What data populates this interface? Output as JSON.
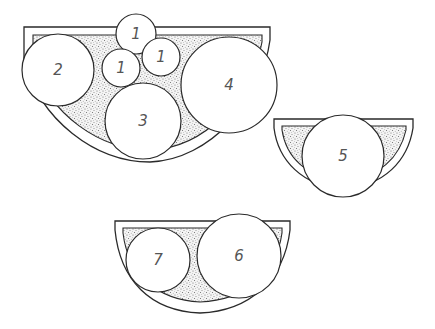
{
  "diagram": {
    "type": "planting-plan",
    "colors": {
      "line": "#2a2a2a",
      "soil_stipple": "#8a8a8a",
      "label": "#555555",
      "background": "#ffffff"
    },
    "containers": [
      {
        "id": "large-planter",
        "plants": [
          {
            "label": "1",
            "cx": 136,
            "cy": 34,
            "r": 20
          },
          {
            "label": "1",
            "cx": 121,
            "cy": 68,
            "r": 19
          },
          {
            "label": "1",
            "cx": 161,
            "cy": 57,
            "r": 19
          },
          {
            "label": "2",
            "cx": 58,
            "cy": 70,
            "r": 36
          },
          {
            "label": "3",
            "cx": 143,
            "cy": 121,
            "r": 38
          },
          {
            "label": "4",
            "cx": 229,
            "cy": 85,
            "r": 48
          }
        ]
      },
      {
        "id": "small-planter-right",
        "plants": [
          {
            "label": "5",
            "cx": 343,
            "cy": 156,
            "r": 41
          }
        ]
      },
      {
        "id": "medium-planter-bottom",
        "plants": [
          {
            "label": "7",
            "cx": 158,
            "cy": 260,
            "r": 32
          },
          {
            "label": "6",
            "cx": 239,
            "cy": 256,
            "r": 42
          }
        ]
      }
    ]
  }
}
